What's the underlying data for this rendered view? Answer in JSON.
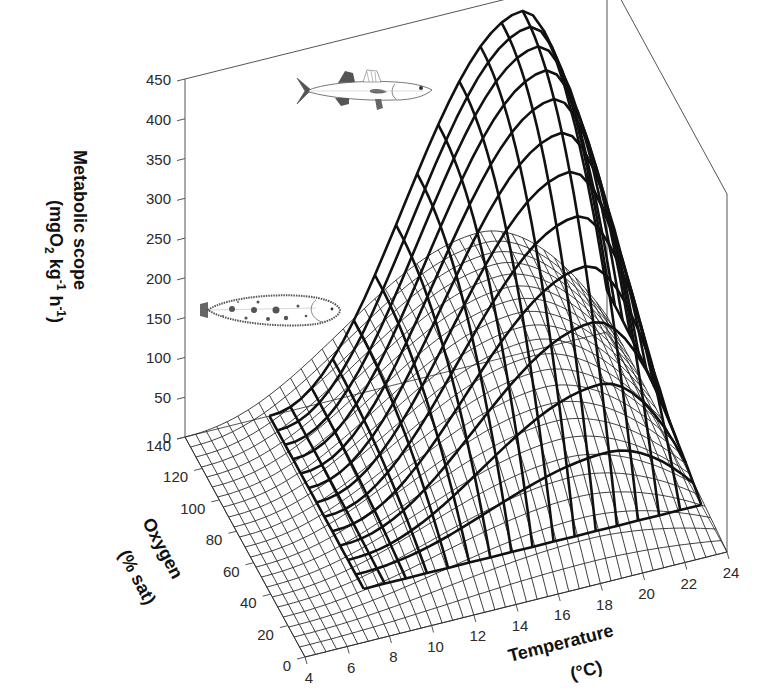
{
  "chart_data": {
    "type": "surface3d",
    "title": "",
    "axes": {
      "z": {
        "label_line1": "Metabolic scope",
        "label_line2_parts": [
          "(mgO",
          "2",
          " kg",
          "-1",
          " h",
          "-1",
          ")"
        ],
        "ticks": [
          0,
          50,
          100,
          150,
          200,
          250,
          300,
          350,
          400,
          450
        ],
        "range": [
          0,
          450
        ]
      },
      "oxygen": {
        "label_line1": "Oxygen",
        "label_line2": "(% sat)",
        "ticks": [
          0,
          20,
          40,
          60,
          80,
          100,
          120,
          140
        ],
        "range": [
          0,
          140
        ]
      },
      "temperature": {
        "label_line1": "Temperature",
        "label_line2": "(°C)",
        "ticks": [
          4,
          6,
          8,
          10,
          12,
          14,
          16,
          18,
          20,
          22,
          24
        ],
        "range": [
          4,
          24
        ]
      }
    },
    "grid": false,
    "legend": "none (species indicated by fish illustrations)",
    "series": [
      {
        "name": "sea bass (upper fish illustration)",
        "style": "thick wireframe",
        "peak_value": 430,
        "peak_temperature": 20,
        "peak_oxygen": 140,
        "temperature_span": [
          8,
          24
        ],
        "oxygen_span": [
          30,
          140
        ],
        "value_at_min_oxygen": 0,
        "shape": "rises steeply with temperature and oxygen to a maximum near 20–21 °C at full saturation, dropping sharply at 24 °C"
      },
      {
        "name": "sole (lower flatfish illustration)",
        "style": "thin fine wireframe",
        "peak_value": 165,
        "peak_temperature": 18,
        "peak_oxygen": 140,
        "temperature_span": [
          4,
          24
        ],
        "oxygen_span": [
          0,
          140
        ],
        "value_at_min_oxygen": 0,
        "shape": "broad low dome with maximum around 18 °C at high oxygen"
      }
    ],
    "annotations": [
      "sea-bass-illustration",
      "sole-illustration"
    ]
  }
}
